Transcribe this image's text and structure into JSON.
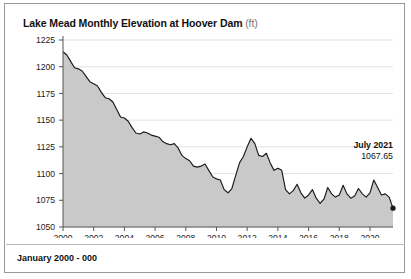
{
  "title": {
    "main": "Lake Mead Monthly Elevation at Hoover Dam",
    "unit": "(ft)"
  },
  "footer": {
    "text": "January 2000 - 000"
  },
  "annotation": {
    "label": "July 2021",
    "value": "1067.65"
  },
  "colors": {
    "line": "#1a1a1a",
    "fill": "#c9c9c9",
    "grid": "#e3e3e3",
    "axis": "#555555",
    "border": "#9a9a9a",
    "text": "#111111",
    "unit_text": "#777777"
  },
  "chart_data": {
    "type": "area",
    "title": "Lake Mead Monthly Elevation at Hoover Dam (ft)",
    "subtitle": "January 2000 - 000",
    "xlabel": "",
    "ylabel": "",
    "grid": true,
    "legend": null,
    "xlim": [
      2000.0,
      2021.5
    ],
    "ylim": [
      1050,
      1225
    ],
    "yticks": [
      1050,
      1075,
      1100,
      1125,
      1150,
      1175,
      1200,
      1225
    ],
    "ytick_labels": [
      "1050",
      "1075",
      "1100",
      "1125",
      "1150",
      "1175",
      "1200",
      "1225"
    ],
    "xticks": [
      2000,
      2002,
      2004,
      2006,
      2008,
      2010,
      2012,
      2014,
      2016,
      2018,
      2020
    ],
    "xtick_labels": [
      "2000",
      "2002",
      "2004",
      "2006",
      "2008",
      "2010",
      "2012",
      "2014",
      "2016",
      "2018",
      "2020"
    ],
    "annotations": [
      {
        "x": 2021.5,
        "y": 1067.65,
        "label": "July 2021",
        "value": "1067.65",
        "marker": "dot"
      }
    ],
    "series": [
      {
        "name": "Lake Mead elevation",
        "x": [
          2000.0,
          2000.25,
          2000.5,
          2000.75,
          2001.0,
          2001.25,
          2001.5,
          2001.75,
          2002.0,
          2002.25,
          2002.5,
          2002.75,
          2003.0,
          2003.25,
          2003.5,
          2003.75,
          2004.0,
          2004.25,
          2004.5,
          2004.75,
          2005.0,
          2005.25,
          2005.5,
          2005.75,
          2006.0,
          2006.25,
          2006.5,
          2006.75,
          2007.0,
          2007.25,
          2007.5,
          2007.75,
          2008.0,
          2008.25,
          2008.5,
          2008.75,
          2009.0,
          2009.25,
          2009.5,
          2009.75,
          2010.0,
          2010.25,
          2010.5,
          2010.75,
          2011.0,
          2011.25,
          2011.5,
          2011.75,
          2012.0,
          2012.25,
          2012.5,
          2012.75,
          2013.0,
          2013.25,
          2013.5,
          2013.75,
          2014.0,
          2014.25,
          2014.5,
          2014.75,
          2015.0,
          2015.25,
          2015.5,
          2015.75,
          2016.0,
          2016.25,
          2016.5,
          2016.75,
          2017.0,
          2017.25,
          2017.5,
          2017.75,
          2018.0,
          2018.25,
          2018.5,
          2018.75,
          2019.0,
          2019.25,
          2019.5,
          2019.75,
          2020.0,
          2020.25,
          2020.5,
          2020.75,
          2021.0,
          2021.25,
          2021.5
        ],
        "values": [
          1214.0,
          1211.0,
          1205.0,
          1199.0,
          1198.0,
          1196.0,
          1191.0,
          1186.0,
          1184.0,
          1182.0,
          1176.0,
          1171.0,
          1170.0,
          1167.0,
          1160.0,
          1153.0,
          1152.0,
          1149.0,
          1143.0,
          1138.0,
          1137.0,
          1139.0,
          1138.0,
          1136.0,
          1135.0,
          1134.0,
          1130.0,
          1128.0,
          1127.0,
          1128.0,
          1124.0,
          1117.0,
          1114.0,
          1112.0,
          1107.0,
          1106.0,
          1107.0,
          1109.0,
          1103.0,
          1097.0,
          1095.0,
          1094.0,
          1085.0,
          1082.0,
          1086.0,
          1098.0,
          1110.0,
          1116.0,
          1125.0,
          1133.0,
          1128.0,
          1117.0,
          1116.0,
          1119.0,
          1110.0,
          1103.0,
          1105.0,
          1103.0,
          1085.0,
          1081.0,
          1084.0,
          1090.0,
          1082.0,
          1077.0,
          1080.0,
          1085.0,
          1077.0,
          1072.0,
          1076.0,
          1087.0,
          1081.0,
          1078.0,
          1080.0,
          1089.0,
          1081.0,
          1077.0,
          1079.0,
          1086.0,
          1081.0,
          1078.0,
          1082.0,
          1094.0,
          1087.0,
          1080.0,
          1081.0,
          1078.0,
          1067.65
        ]
      }
    ]
  }
}
